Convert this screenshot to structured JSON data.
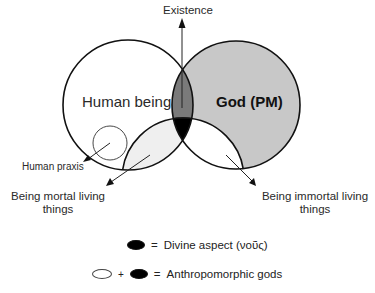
{
  "diagram": {
    "type": "venn",
    "axis_label": "Existence",
    "sets": {
      "human": {
        "label": "Human being",
        "fill": "#ffffff"
      },
      "god": {
        "label": "God (PM)",
        "fill": "#c8c8c8"
      },
      "living": {
        "label_mortal": "Being mortal living things",
        "label_immortal": "Being immortal living things"
      }
    },
    "regions": {
      "human_god": {
        "fill": "#7a7a7a"
      },
      "human_god_living": {
        "fill": "#000000"
      },
      "human_living": {
        "fill": "#efefef"
      },
      "god_living": {
        "fill": "#ffffff"
      }
    },
    "annotations": {
      "human_praxis": "Human praxis",
      "mortal_line1": "Being mortal living",
      "mortal_line2": "things",
      "immortal_line1": "Being immortal living",
      "immortal_line2": "things"
    }
  },
  "legend": {
    "row1": {
      "equals": "=",
      "text": "Divine aspect (νοῦς)"
    },
    "row2": {
      "plus": "+",
      "equals": "=",
      "text": "Anthropomorphic gods"
    }
  }
}
